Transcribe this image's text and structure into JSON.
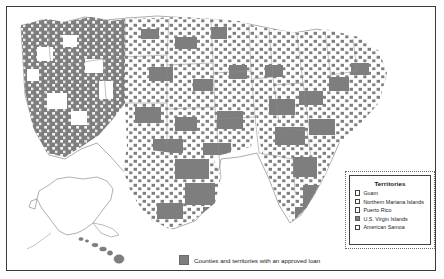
{
  "map": {
    "kind": "choropleth",
    "region": "United States counties and territories",
    "fill_color": "#7e7e7e",
    "empty_color": "#ffffff",
    "outline_color": "#6f6f6f",
    "background_color": "#ffffff",
    "frame_color": "#3a3a3a",
    "insets": [
      {
        "name": "alaska",
        "filled": false
      },
      {
        "name": "hawaii",
        "filled": true
      }
    ]
  },
  "territories_legend": {
    "title": "Territories",
    "items": [
      {
        "label": "Guam",
        "filled": false
      },
      {
        "label": "Northern Mariana Islands",
        "filled": false
      },
      {
        "label": "Puerto Rico",
        "filled": false
      },
      {
        "label": "U.S. Virgin Islands",
        "filled": true
      },
      {
        "label": "American Samoa",
        "filled": false
      }
    ]
  },
  "bottom_legend": {
    "swatch_color": "#7e7e7e",
    "label": "Counties and territories with an approved loan"
  }
}
